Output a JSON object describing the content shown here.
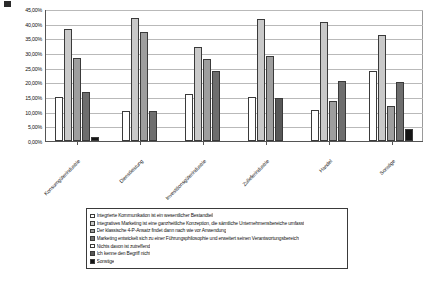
{
  "corner_marker": "black-square-marker",
  "chart_data": {
    "type": "bar",
    "title": "",
    "xlabel": "",
    "ylabel": "",
    "ylim": [
      0,
      45
    ],
    "ytick_labels": [
      "45,00%",
      "40,00%",
      "35,00%",
      "30,00%",
      "25,00%",
      "20,00%",
      "15,00%",
      "10,00%",
      "5,00%",
      "0,00%"
    ],
    "ytick_values": [
      45,
      40,
      35,
      30,
      25,
      20,
      15,
      10,
      5,
      0
    ],
    "grid": true,
    "legend_position": "bottom",
    "categories": [
      "Konsumgüterindustrie",
      "Dienstleistung",
      "Investitionsgüterindustrie",
      "Zulieferindustrie",
      "Handel",
      "Sonstige"
    ],
    "series": [
      {
        "name": "Integrierte Kommunikation ist ein wesentlicher Bestandteil",
        "color": "#ffffff",
        "values": [
          15.0,
          10.4,
          16.0,
          15.0,
          10.5,
          24.0
        ]
      },
      {
        "name": "Integratives Marketing ist eine ganzheitliche Konzeption, die sämtliche Unternehmensbereiche umfasst",
        "color": "#c9c9c9",
        "values": [
          38.3,
          42.0,
          32.0,
          41.5,
          40.5,
          36.0
        ]
      },
      {
        "name": "Der klassische 4-P-Ansatz findet dann nach wie vor Anwendung",
        "color": "#9e9e9e",
        "values": [
          28.3,
          37.0,
          28.0,
          29.0,
          13.5,
          12.0
        ]
      },
      {
        "name": "Marketing entwickelt sich zu einer Führungsphilosophie und erweitert seinen Verantwortungsbereich",
        "color": "#6e6e6e",
        "values": [
          16.6,
          10.4,
          24.0,
          0.0,
          20.5,
          20.0
        ]
      },
      {
        "name": "Nichts davon ist zutreffend",
        "color": "#ffffff",
        "values": [
          0.0,
          0.0,
          0.0,
          0.0,
          0.0,
          0.0
        ]
      },
      {
        "name": "Ich kenne den Begriff nicht",
        "color": "#585858",
        "values": [
          0.0,
          0.0,
          0.0,
          14.5,
          0.0,
          0.0
        ]
      },
      {
        "name": "Sonstige",
        "color": "#151515",
        "values": [
          1.5,
          0.0,
          0.0,
          0.0,
          0.0,
          4.0
        ]
      }
    ]
  }
}
